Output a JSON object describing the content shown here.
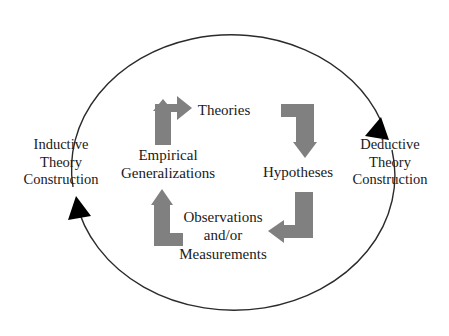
{
  "diagram": {
    "background_color": "#ffffff",
    "outer": {
      "arc_color": "#2b2b2b",
      "arrowhead_color": "#000000",
      "labels": {
        "left": "Inductive\nTheory\nConstruction",
        "right": "Deductive\nTheory\nConstruction"
      },
      "arrowheads": [
        {
          "name": "deductive-arrowhead",
          "position": "right",
          "direction": "down-left"
        },
        {
          "name": "inductive-arrowhead",
          "position": "left",
          "direction": "up-right"
        }
      ]
    },
    "inner": {
      "arrow_color": "#808080",
      "nodes": [
        {
          "id": "theories",
          "label": "Theories"
        },
        {
          "id": "hypotheses",
          "label": "Hypotheses"
        },
        {
          "id": "observations",
          "label": "Observations\nand/or\nMeasurements"
        },
        {
          "id": "empirical-generalizations",
          "label": "Empirical\nGeneralizations"
        }
      ],
      "arrows": [
        {
          "name": "arrow-generalizations-to-theories",
          "from": "empirical-generalizations",
          "to": "theories",
          "shape": "up-then-right"
        },
        {
          "name": "arrow-theories-to-hypotheses",
          "from": "theories",
          "to": "hypotheses",
          "shape": "right-then-down"
        },
        {
          "name": "arrow-hypotheses-to-observations",
          "from": "hypotheses",
          "to": "observations",
          "shape": "down-then-left"
        },
        {
          "name": "arrow-observations-to-generalizations",
          "from": "observations",
          "to": "empirical-generalizations",
          "shape": "left-then-up"
        }
      ]
    }
  }
}
